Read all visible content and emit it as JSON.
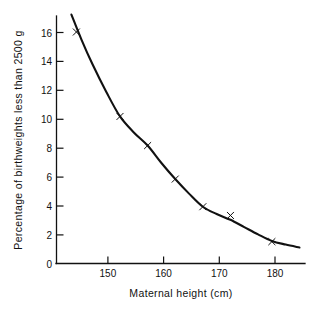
{
  "chart_data": {
    "type": "scatter",
    "title": "",
    "subtitle": "",
    "xlabel": "Maternal height (cm)",
    "ylabel": "Percentage of birthweights less than 2500 g",
    "xlim": [
      141,
      186
    ],
    "ylim": [
      0,
      17
    ],
    "grid": false,
    "legend": null,
    "legend_position": "none",
    "xticks": [
      150,
      160,
      170,
      180
    ],
    "xtick_labels": [
      "150",
      "160",
      "170",
      "180"
    ],
    "yticks": [
      0,
      2,
      4,
      6,
      8,
      10,
      12,
      14,
      16
    ],
    "ytick_labels": [
      "0",
      "2",
      "4",
      "6",
      "8",
      "10",
      "12",
      "14",
      "16"
    ],
    "marker": "x",
    "color": "#111111",
    "x": [
      144.6,
      152.5,
      157.5,
      162.5,
      167.5,
      172.5,
      180.0
    ],
    "y": [
      15.9,
      10.1,
      8.1,
      5.8,
      3.9,
      3.3,
      1.5
    ],
    "points": [
      {
        "x": 144.6,
        "y": 15.9
      },
      {
        "x": 152.5,
        "y": 10.1
      },
      {
        "x": 157.5,
        "y": 8.1
      },
      {
        "x": 162.5,
        "y": 5.8
      },
      {
        "x": 167.5,
        "y": 3.9
      },
      {
        "x": 172.5,
        "y": 3.3
      },
      {
        "x": 180.0,
        "y": 1.5
      }
    ],
    "fitted_curve": {
      "label": "",
      "x": [
        143.7,
        145.5,
        147.5,
        150.0,
        152.5,
        155.0,
        157.5,
        160.0,
        162.5,
        165.0,
        167.5,
        170.0,
        172.5,
        175.0,
        177.5,
        180.0,
        182.5,
        185.0
      ],
      "y": [
        17.1,
        15.4,
        13.7,
        11.8,
        10.1,
        9.0,
        8.1,
        6.9,
        5.8,
        4.8,
        3.9,
        3.4,
        3.0,
        2.5,
        2.0,
        1.55,
        1.3,
        1.1
      ]
    },
    "annotations": []
  },
  "axes": {
    "x_axis_name": "x-axis",
    "y_axis_name": "y-axis"
  }
}
